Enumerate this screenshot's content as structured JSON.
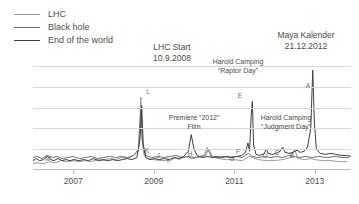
{
  "legend": {
    "position": "top-left",
    "items": [
      {
        "label": "LHC",
        "color": "#9a9a9a",
        "width": 1.6,
        "name": "lhc"
      },
      {
        "label": "Black hole",
        "color": "#6e6e6e",
        "width": 1.8,
        "name": "black-hole"
      },
      {
        "label": "End of the world",
        "color": "#3f3f3f",
        "width": 1.8,
        "name": "end-of-the-world"
      }
    ]
  },
  "callouts": [
    {
      "id": "lhc-start",
      "line1": "LHC Start",
      "line2": "10.9.2008",
      "x": 172,
      "y": 42,
      "align": "center",
      "size": "normal"
    },
    {
      "id": "maya-kalender",
      "line1": "Maya Kalender",
      "line2": "21.12.2012",
      "x": 306,
      "y": 30,
      "align": "center",
      "size": "normal"
    },
    {
      "id": "harold-raptor",
      "line1": "Harold Camping",
      "line2": "“Raptor Day”",
      "x": 238,
      "y": 57,
      "align": "center",
      "size": "small"
    },
    {
      "id": "premiere-2012",
      "line1": "Premiere “2012”",
      "line2": "Film",
      "x": 194,
      "y": 113,
      "align": "center",
      "size": "small"
    },
    {
      "id": "harold-judgment",
      "line1": "Harold Camping",
      "line2": "“Judgment Day”",
      "x": 286,
      "y": 113,
      "align": "center",
      "size": "small"
    }
  ],
  "chart_data": {
    "type": "line",
    "title": "",
    "xlabel": "",
    "ylabel": "",
    "grid": true,
    "gridlines_y": [
      0.2,
      0.4,
      0.6,
      0.8,
      1.0
    ],
    "xlim": [
      2006.0,
      2013.9
    ],
    "ylim": [
      0,
      100
    ],
    "xticks": [
      2007,
      2009,
      2011,
      2013
    ],
    "xticklabels": [
      "2007",
      "2009",
      "2011",
      "2013"
    ],
    "series": [
      {
        "name": "LHC",
        "color": "#9a9a9a",
        "width": 1.0,
        "points": [
          [
            2006.0,
            6
          ],
          [
            2006.12,
            7
          ],
          [
            2006.25,
            6
          ],
          [
            2006.4,
            8
          ],
          [
            2006.55,
            7
          ],
          [
            2006.7,
            9
          ],
          [
            2006.85,
            8
          ],
          [
            2007.0,
            9
          ],
          [
            2007.15,
            8
          ],
          [
            2007.3,
            9
          ],
          [
            2007.45,
            8
          ],
          [
            2007.6,
            10
          ],
          [
            2007.75,
            9
          ],
          [
            2007.9,
            11
          ],
          [
            2008.05,
            10
          ],
          [
            2008.2,
            12
          ],
          [
            2008.35,
            11
          ],
          [
            2008.5,
            14
          ],
          [
            2008.62,
            18
          ],
          [
            2008.68,
            70
          ],
          [
            2008.71,
            30
          ],
          [
            2008.76,
            14
          ],
          [
            2008.85,
            11
          ],
          [
            2009.0,
            10
          ],
          [
            2009.2,
            9
          ],
          [
            2009.4,
            9
          ],
          [
            2009.55,
            12
          ],
          [
            2009.62,
            10
          ],
          [
            2009.8,
            13
          ],
          [
            2009.95,
            11
          ],
          [
            2010.1,
            12
          ],
          [
            2010.25,
            14
          ],
          [
            2010.33,
            22
          ],
          [
            2010.42,
            13
          ],
          [
            2010.6,
            11
          ],
          [
            2010.8,
            10
          ],
          [
            2011.0,
            10
          ],
          [
            2011.2,
            9
          ],
          [
            2011.36,
            13
          ],
          [
            2011.45,
            12
          ],
          [
            2011.6,
            10
          ],
          [
            2011.8,
            9
          ],
          [
            2012.0,
            9
          ],
          [
            2012.2,
            10
          ],
          [
            2012.4,
            12
          ],
          [
            2012.5,
            20
          ],
          [
            2012.58,
            11
          ],
          [
            2012.75,
            10
          ],
          [
            2012.9,
            11
          ],
          [
            2013.0,
            10
          ],
          [
            2013.2,
            9
          ],
          [
            2013.4,
            9
          ],
          [
            2013.6,
            8
          ],
          [
            2013.8,
            8
          ]
        ]
      },
      {
        "name": "Black hole",
        "color": "#6e6e6e",
        "width": 1.0,
        "points": [
          [
            2006.0,
            12
          ],
          [
            2006.1,
            13
          ],
          [
            2006.22,
            11
          ],
          [
            2006.35,
            14
          ],
          [
            2006.48,
            12
          ],
          [
            2006.6,
            13
          ],
          [
            2006.72,
            11
          ],
          [
            2006.85,
            12
          ],
          [
            2007.0,
            13
          ],
          [
            2007.15,
            11
          ],
          [
            2007.3,
            12
          ],
          [
            2007.45,
            13
          ],
          [
            2007.6,
            11
          ],
          [
            2007.75,
            12
          ],
          [
            2007.9,
            13
          ],
          [
            2008.05,
            12
          ],
          [
            2008.2,
            13
          ],
          [
            2008.35,
            12
          ],
          [
            2008.5,
            14
          ],
          [
            2008.62,
            20
          ],
          [
            2008.68,
            58
          ],
          [
            2008.72,
            26
          ],
          [
            2008.8,
            14
          ],
          [
            2008.95,
            12
          ],
          [
            2009.1,
            13
          ],
          [
            2009.25,
            12
          ],
          [
            2009.4,
            13
          ],
          [
            2009.55,
            14
          ],
          [
            2009.7,
            12
          ],
          [
            2009.85,
            13
          ],
          [
            2010.0,
            12
          ],
          [
            2010.15,
            13
          ],
          [
            2010.28,
            14
          ],
          [
            2010.36,
            20
          ],
          [
            2010.45,
            13
          ],
          [
            2010.6,
            12
          ],
          [
            2010.75,
            13
          ],
          [
            2010.9,
            12
          ],
          [
            2011.05,
            13
          ],
          [
            2011.2,
            12
          ],
          [
            2011.35,
            16
          ],
          [
            2011.45,
            13
          ],
          [
            2011.6,
            12
          ],
          [
            2011.75,
            13
          ],
          [
            2011.9,
            12
          ],
          [
            2012.05,
            13
          ],
          [
            2012.2,
            12
          ],
          [
            2012.35,
            14
          ],
          [
            2012.48,
            13
          ],
          [
            2012.62,
            12
          ],
          [
            2012.78,
            13
          ],
          [
            2012.92,
            12
          ],
          [
            2013.1,
            13
          ],
          [
            2013.3,
            12
          ],
          [
            2013.5,
            13
          ],
          [
            2013.7,
            12
          ],
          [
            2013.85,
            12
          ]
        ]
      },
      {
        "name": "End of the world",
        "color": "#3f3f3f",
        "width": 1.0,
        "points": [
          [
            2006.0,
            9
          ],
          [
            2006.08,
            11
          ],
          [
            2006.16,
            9
          ],
          [
            2006.26,
            10
          ],
          [
            2006.36,
            13
          ],
          [
            2006.44,
            10
          ],
          [
            2006.52,
            9
          ],
          [
            2006.62,
            11
          ],
          [
            2006.72,
            9
          ],
          [
            2006.82,
            10
          ],
          [
            2006.92,
            9
          ],
          [
            2007.02,
            10
          ],
          [
            2007.14,
            9
          ],
          [
            2007.26,
            10
          ],
          [
            2007.38,
            9
          ],
          [
            2007.5,
            11
          ],
          [
            2007.62,
            9
          ],
          [
            2007.74,
            10
          ],
          [
            2007.86,
            9
          ],
          [
            2007.98,
            10
          ],
          [
            2008.1,
            9
          ],
          [
            2008.22,
            10
          ],
          [
            2008.34,
            11
          ],
          [
            2008.46,
            10
          ],
          [
            2008.58,
            12
          ],
          [
            2008.66,
            30
          ],
          [
            2008.7,
            62
          ],
          [
            2008.74,
            24
          ],
          [
            2008.8,
            12
          ],
          [
            2008.9,
            10
          ],
          [
            2009.02,
            11
          ],
          [
            2009.14,
            10
          ],
          [
            2009.26,
            11
          ],
          [
            2009.38,
            10
          ],
          [
            2009.5,
            12
          ],
          [
            2009.62,
            11
          ],
          [
            2009.74,
            13
          ],
          [
            2009.86,
            18
          ],
          [
            2009.93,
            34
          ],
          [
            2010.0,
            20
          ],
          [
            2010.08,
            14
          ],
          [
            2010.2,
            12
          ],
          [
            2010.34,
            13
          ],
          [
            2010.46,
            12
          ],
          [
            2010.58,
            13
          ],
          [
            2010.7,
            12
          ],
          [
            2010.82,
            13
          ],
          [
            2010.94,
            12
          ],
          [
            2011.06,
            13
          ],
          [
            2011.18,
            14
          ],
          [
            2011.28,
            17
          ],
          [
            2011.34,
            26
          ],
          [
            2011.38,
            18
          ],
          [
            2011.42,
            52
          ],
          [
            2011.45,
            66
          ],
          [
            2011.48,
            24
          ],
          [
            2011.54,
            15
          ],
          [
            2011.62,
            14
          ],
          [
            2011.72,
            15
          ],
          [
            2011.8,
            20
          ],
          [
            2011.84,
            16
          ],
          [
            2011.94,
            15
          ],
          [
            2012.04,
            16
          ],
          [
            2012.14,
            18
          ],
          [
            2012.2,
            22
          ],
          [
            2012.26,
            17
          ],
          [
            2012.36,
            16
          ],
          [
            2012.46,
            17
          ],
          [
            2012.56,
            19
          ],
          [
            2012.64,
            17
          ],
          [
            2012.74,
            18
          ],
          [
            2012.82,
            22
          ],
          [
            2012.9,
            40
          ],
          [
            2012.95,
            96
          ],
          [
            2012.99,
            46
          ],
          [
            2013.04,
            20
          ],
          [
            2013.14,
            16
          ],
          [
            2013.26,
            15
          ],
          [
            2013.4,
            16
          ],
          [
            2013.52,
            15
          ],
          [
            2013.66,
            14
          ],
          [
            2013.8,
            14
          ],
          [
            2013.9,
            13
          ]
        ]
      }
    ],
    "point_labels": [
      {
        "label": "M",
        "x": 48,
        "y": 155
      },
      {
        "label": "L",
        "x": 148,
        "y": 88
      },
      {
        "label": "K",
        "x": 147,
        "y": 147
      },
      {
        "label": "J",
        "x": 158,
        "y": 152
      },
      {
        "label": "I",
        "x": 168,
        "y": 157
      },
      {
        "label": "H",
        "x": 190,
        "y": 150
      },
      {
        "label": "G",
        "x": 232,
        "y": 155
      },
      {
        "label": "F",
        "x": 238,
        "y": 148
      },
      {
        "label": "E",
        "x": 240,
        "y": 92
      },
      {
        "label": "D",
        "x": 265,
        "y": 152
      },
      {
        "label": "C",
        "x": 277,
        "y": 149
      },
      {
        "label": "B",
        "x": 292,
        "y": 152
      },
      {
        "label": "A",
        "x": 308,
        "y": 82
      }
    ]
  }
}
